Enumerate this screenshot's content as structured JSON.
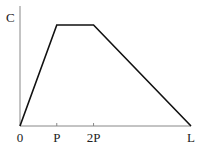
{
  "chart_data": {
    "type": "line",
    "title": "",
    "xlabel": "",
    "ylabel": "C",
    "x_ticks": [
      {
        "label": "0",
        "value": 0
      },
      {
        "label": "P",
        "value": 1
      },
      {
        "label": "2P",
        "value": 2
      },
      {
        "label": "L",
        "value": 4.65
      }
    ],
    "xlim": [
      0,
      4.65
    ],
    "ylim": [
      0,
      1.2
    ],
    "series": [
      {
        "name": "C",
        "x": [
          0,
          1,
          2,
          4.65
        ],
        "y": [
          0,
          1,
          1,
          0
        ]
      }
    ],
    "grid": false,
    "legend": "none"
  }
}
